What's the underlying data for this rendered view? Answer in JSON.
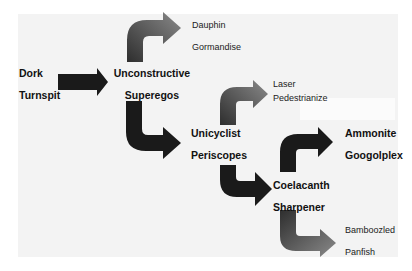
{
  "diagram": {
    "type": "hierarchical-arrow-flow",
    "nodes": {
      "root": {
        "line1": "Dork",
        "line2": "Turnspit"
      },
      "level1": {
        "line1": "Unconstructive",
        "line2": "Superegos"
      },
      "leaf_a": {
        "line1": "Dauphin",
        "line2": "Gormandise"
      },
      "level2": {
        "line1": "Unicyclist",
        "line2": "Periscopes"
      },
      "leaf_b": {
        "line1": "Laser",
        "line2": "Pedestrianize"
      },
      "level3": {
        "line1": "Coelacanth",
        "line2": "Sharpener"
      },
      "leaf_c": {
        "line1": "Ammonite",
        "line2": "Googolplex"
      },
      "leaf_d": {
        "line1": "Bamboozled",
        "line2": "Panfish"
      }
    },
    "edges": [
      {
        "from": "Dork Turnspit",
        "to": "Unconstructive Superegos",
        "style": "straight-right"
      },
      {
        "from": "Unconstructive Superegos",
        "to": "Dauphin Gormandise",
        "style": "bend-up-right"
      },
      {
        "from": "Unconstructive Superegos",
        "to": "Unicyclist Periscopes",
        "style": "bend-down-right"
      },
      {
        "from": "Unicyclist Periscopes",
        "to": "Laser Pedestrianize",
        "style": "bend-up-right"
      },
      {
        "from": "Unicyclist Periscopes",
        "to": "Coelacanth Sharpener",
        "style": "bend-down-right"
      },
      {
        "from": "Coelacanth Sharpener",
        "to": "Ammonite Googolplex",
        "style": "bend-up-right"
      },
      {
        "from": "Coelacanth Sharpener",
        "to": "Bamboozled Panfish",
        "style": "bend-down-right"
      }
    ],
    "colors": {
      "background": "#ffffff",
      "panel": "#f3f3f3",
      "arrow_dark": "#1a1a1a",
      "arrow_gradient_start": "#2e2e2e",
      "arrow_gradient_end": "#8a8a8a",
      "text": "#111111"
    }
  }
}
